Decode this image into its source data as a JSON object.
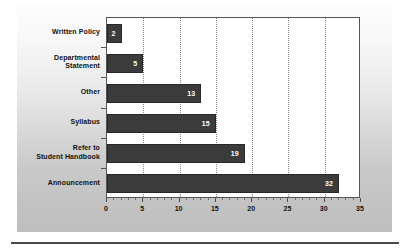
{
  "chart_data": {
    "type": "bar",
    "orientation": "horizontal",
    "title": "",
    "subtitle": "",
    "xlabel": "",
    "ylabel": "",
    "xlim": [
      0,
      35
    ],
    "xticks": [
      0,
      5,
      10,
      15,
      20,
      25,
      30,
      35
    ],
    "xtick_labels": [
      "0",
      "5",
      "10",
      "15",
      "20",
      "25",
      "30",
      "35"
    ],
    "minor_tick_step": 1,
    "gridlines": [
      5,
      10,
      15,
      20,
      25,
      30
    ],
    "grid": true,
    "grid_style": "dotted",
    "legend": null,
    "categories": [
      "Written Policy",
      "Departmental Statement",
      "Other",
      "Syllabus",
      "Refer to Student Handbook",
      "Announcement"
    ],
    "category_label_lines": [
      [
        "Written Policy"
      ],
      [
        "Departmental",
        "Statement"
      ],
      [
        "Other"
      ],
      [
        "Syllabus"
      ],
      [
        "Refer to",
        "Student Handbook"
      ],
      [
        "Announcement"
      ]
    ],
    "values": [
      2,
      5,
      13,
      15,
      19,
      32
    ],
    "value_labels": [
      "2",
      "5",
      "13",
      "15",
      "19",
      "32"
    ],
    "bar_color": "#3b3b3b",
    "bar_edge_color": "#272727",
    "value_label_color": "#ffffff",
    "plot_background": "#ffffff",
    "panel_background": "#d3d3d3",
    "axis_color": "#555555"
  }
}
